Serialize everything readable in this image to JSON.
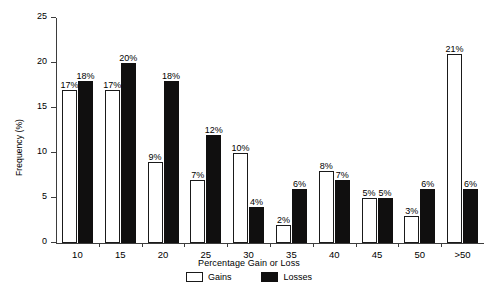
{
  "chart_data": {
    "type": "bar",
    "title": "",
    "xlabel": "Percentage Gain or Loss",
    "ylabel": "Frequency (%)",
    "categories": [
      "10",
      "15",
      "20",
      "25",
      "30",
      "35",
      "40",
      "45",
      "50",
      ">50"
    ],
    "series": [
      {
        "name": "Gains",
        "values": [
          17,
          17,
          9,
          7,
          10,
          2,
          8,
          5,
          3,
          21
        ],
        "labels": [
          "17%",
          "17%",
          "9%",
          "7%",
          "10%",
          "2%",
          "8%",
          "5%",
          "3%",
          "21%"
        ],
        "fill": "#ffffff",
        "stroke": "#1a1a1a"
      },
      {
        "name": "Losses",
        "values": [
          18,
          20,
          18,
          12,
          4,
          6,
          7,
          5,
          6,
          6
        ],
        "labels": [
          "18%",
          "20%",
          "18%",
          "12%",
          "4%",
          "6%",
          "7%",
          "5%",
          "6%",
          "6%"
        ],
        "fill": "#100f0f",
        "stroke": "#100f0f"
      }
    ],
    "ylim": [
      0,
      25
    ],
    "yticks": [
      0,
      5,
      10,
      15,
      20,
      25
    ],
    "ytick_labels": [
      "0",
      "5",
      "10",
      "15",
      "20",
      "25"
    ],
    "grid": false,
    "legend_position": "bottom-center"
  },
  "legend": {
    "items": [
      {
        "label": "Gains",
        "style": "gains"
      },
      {
        "label": "Losses",
        "style": "losses"
      }
    ]
  },
  "colors": {
    "axis": "#3d3d3d",
    "text": "#000000",
    "background": "#ffffff",
    "gains_fill": "#ffffff",
    "losses_fill": "#100f0f"
  }
}
